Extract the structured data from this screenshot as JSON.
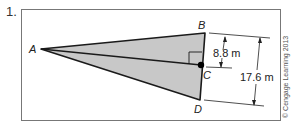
{
  "problem": {
    "number": "1."
  },
  "diagram": {
    "points": {
      "A": {
        "label": "A"
      },
      "B": {
        "label": "B"
      },
      "C": {
        "label": "C"
      },
      "D": {
        "label": "D"
      }
    },
    "dimensions": {
      "BC": "8.8 m",
      "BD": "17.6 m"
    },
    "colors": {
      "fill": "#c8c8c8",
      "stroke": "#1a1a1a",
      "frame": "#777777"
    }
  },
  "credit": "© Cengage Learning 2013"
}
